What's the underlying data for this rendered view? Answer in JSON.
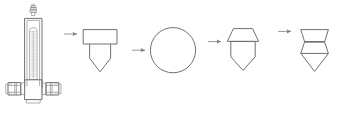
{
  "diagram": {
    "background_color": "#ffffff",
    "line_color": "#6e7173",
    "arrow_color": "#7a7d7f",
    "stages": [
      {
        "id": "stage-1",
        "name": "rotameter-flow-meter",
        "label": "",
        "description": "Vertical variable-area flow meter with graduated scale tube, top valve cap and two hexagonal pipe-union fittings at the base"
      },
      {
        "id": "stage-2",
        "name": "rectangle-with-pointed-base",
        "label": "",
        "description": "Horizontal rectangle above a downward pentagon point"
      },
      {
        "id": "stage-3",
        "name": "circle",
        "label": "",
        "description": "Plain circle outline"
      },
      {
        "id": "stage-4",
        "name": "trapezoid-with-pointed-base",
        "label": "",
        "description": "Flared trapezoid cap above a downward pentagon point"
      },
      {
        "id": "stage-5",
        "name": "hourglass-with-pointed-base",
        "label": "",
        "description": "Concave-sided hourglass band with internal divider line above a downward pentagon point"
      }
    ],
    "arrows": [
      {
        "name": "arrow-1",
        "label": "",
        "from": "stage-1",
        "to": "stage-2",
        "direction": "right"
      },
      {
        "name": "arrow-2",
        "label": "",
        "from": "stage-2",
        "to": "stage-3",
        "direction": "right"
      },
      {
        "name": "arrow-3",
        "label": "",
        "from": "stage-3",
        "to": "stage-4",
        "direction": "right"
      },
      {
        "name": "arrow-4",
        "label": "",
        "from": "stage-4",
        "to": "stage-5",
        "direction": "right"
      }
    ],
    "scale": {
      "tick_count": 26,
      "label": ""
    }
  }
}
